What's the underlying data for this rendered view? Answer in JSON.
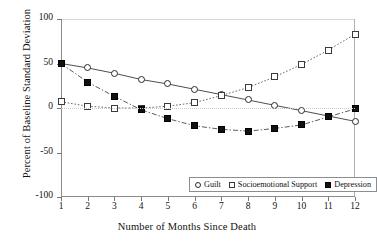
{
  "chart_data": {
    "type": "line",
    "title": "",
    "xlabel": "Number of Months Since Death",
    "ylabel": "Percent of Baseline Standard Deviation",
    "x": [
      1,
      2,
      3,
      4,
      5,
      6,
      7,
      8,
      9,
      10,
      11,
      12
    ],
    "xtick_labels": [
      "1",
      "2",
      "3",
      "4",
      "5",
      "6",
      "7",
      "8",
      "9",
      "10",
      "11",
      "12"
    ],
    "ytick_labels": [
      "100",
      "50",
      "0",
      "-50",
      "-100"
    ],
    "ytick_values": [
      100,
      50,
      0,
      -50,
      -100
    ],
    "xlim": [
      1,
      12
    ],
    "ylim": [
      -100,
      100
    ],
    "grid": false,
    "zero_reference_line": true,
    "legend_position": "inside-bottom-center",
    "series": [
      {
        "name": "Guilt",
        "marker": "open-circle",
        "line_style": "solid",
        "values": [
          50,
          45,
          39,
          32,
          27,
          21,
          15,
          9,
          3,
          -3,
          -9,
          -15
        ]
      },
      {
        "name": "Socioemotional Support",
        "marker": "open-square",
        "line_style": "dotted",
        "values": [
          7,
          2,
          0,
          0,
          2,
          6,
          14,
          23,
          35,
          49,
          65,
          83
        ]
      },
      {
        "name": "Depression",
        "marker": "filled-square",
        "line_style": "dash-dot",
        "values": [
          50,
          29,
          13,
          -2,
          -12,
          -20,
          -24,
          -26,
          -23,
          -19,
          -10,
          -1
        ]
      }
    ]
  },
  "legend": {
    "items": [
      {
        "label": "Guilt",
        "swatch": "open-circle-icon"
      },
      {
        "label": "Socioemotional Support",
        "swatch": "open-square-icon"
      },
      {
        "label": "Depression",
        "swatch": "filled-square-icon"
      }
    ]
  },
  "colors": {
    "series_guilt": "#2b2b2b",
    "series_socio": "#3a3a3a",
    "series_depression": "#111111",
    "axis": "#8a8a8a",
    "background": "#ffffff",
    "text": "#111111"
  }
}
